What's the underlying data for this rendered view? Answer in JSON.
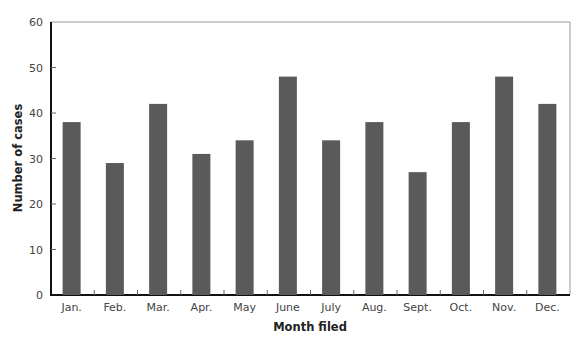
{
  "chart_data": {
    "type": "bar",
    "title": "",
    "xlabel": "Month filed",
    "ylabel": "Number of cases",
    "categories": [
      "Jan.",
      "Feb.",
      "Mar.",
      "Apr.",
      "May",
      "June",
      "July",
      "Aug.",
      "Sept.",
      "Oct.",
      "Nov.",
      "Dec."
    ],
    "values": [
      38,
      29,
      42,
      31,
      34,
      48,
      34,
      38,
      27,
      38,
      48,
      42
    ],
    "ylim": [
      0,
      60
    ],
    "yticks": [
      0,
      10,
      20,
      30,
      40,
      50,
      60
    ],
    "grid": false,
    "legend": null,
    "bar_color": "#5a5a5a"
  }
}
